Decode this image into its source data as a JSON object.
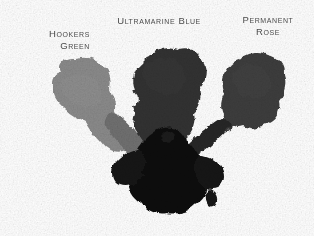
{
  "canvas": {
    "width": 314,
    "height": 236,
    "background_color": "#ffffff"
  },
  "labels": [
    {
      "id": "hookers-green",
      "text": "Hookers\nGreen",
      "color": "#4a4a4a",
      "align": "right"
    },
    {
      "id": "ultramarine-blue",
      "text": "Ultramarine Blue",
      "color": "#4a4a4a",
      "align": "center"
    },
    {
      "id": "permanent-rose",
      "text": "Permanent\nRose",
      "color": "#4a4a4a",
      "align": "center"
    }
  ],
  "swatches": [
    {
      "id": "hookers-green-swatch",
      "label": "Hookers Green",
      "tone": "#8a8a8a",
      "tone_edge": "#7c7c7c",
      "position": "left"
    },
    {
      "id": "ultramarine-blue-swatch",
      "label": "Ultramarine Blue",
      "tone": "#333333",
      "tone_edge": "#2a2a2a",
      "position": "center"
    },
    {
      "id": "permanent-rose-swatch",
      "label": "Permanent Rose",
      "tone": "#3d3d3d",
      "tone_edge": "#343434",
      "position": "right"
    },
    {
      "id": "merged-pool",
      "label": "Merged ink pool",
      "tone": "#111111",
      "tone_edge": "#0a0a0a",
      "position": "bottom-center"
    }
  ]
}
